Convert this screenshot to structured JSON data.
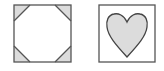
{
  "figures": [
    {
      "name": "square-with-clipped-corners",
      "shape": "square",
      "corner_triangles": 4,
      "stroke": "#555555",
      "fill_corners": "#dcdcdc"
    },
    {
      "name": "heart-in-square",
      "shape": "square",
      "inner_shape": "heart",
      "stroke": "#555555",
      "fill_inner": "#dcdcdc"
    }
  ],
  "colors": {
    "stroke": "#555555",
    "fill": "#dcdcdc",
    "background": "#ffffff"
  }
}
